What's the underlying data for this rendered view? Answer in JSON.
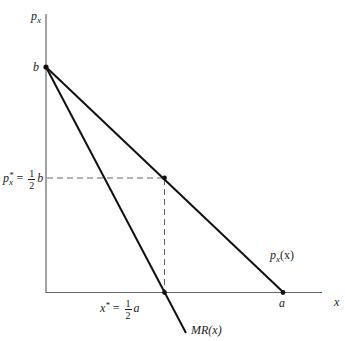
{
  "diagram": {
    "type": "monopoly-linear-demand",
    "axes": {
      "y_label_main": "p",
      "y_label_sub": "x",
      "x_label": "x"
    },
    "points": {
      "b_label": "b",
      "a_label": "a"
    },
    "price_star": {
      "var": "p",
      "sub": "x",
      "sup": "*",
      "eq": "=",
      "frac_num": "1",
      "frac_den": "2",
      "tail": "b"
    },
    "x_star": {
      "var": "x",
      "sup": "*",
      "eq": "=",
      "frac_num": "1",
      "frac_den": "2",
      "tail": "a"
    },
    "curves": {
      "demand_main": "p",
      "demand_sub": "x",
      "demand_arg": "(x)",
      "mr_label": "MR(x)"
    },
    "colors": {
      "line": "#111111",
      "axis": "#555555",
      "dashed": "#555555"
    }
  }
}
